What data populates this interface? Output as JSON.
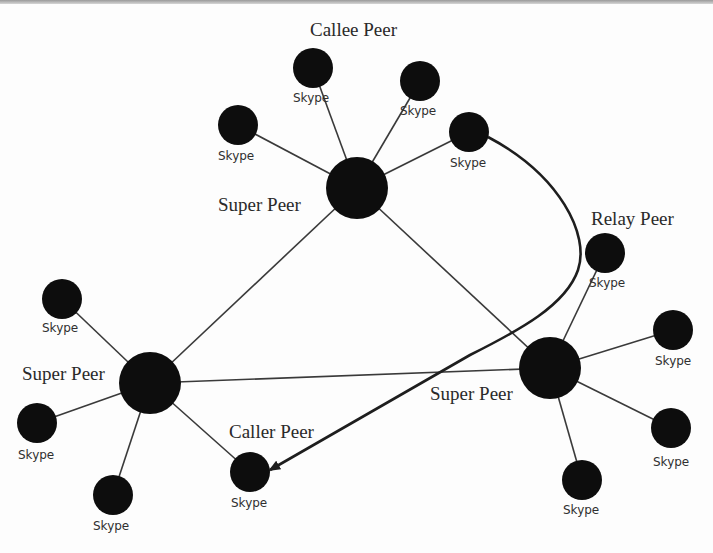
{
  "diagram": {
    "colors": {
      "node": "#0d0d0d",
      "edge": "#3a3a3a",
      "flow": "#1e1e1e",
      "background": "#fdfdfd"
    },
    "roles": {
      "callee": "Callee Peer",
      "relay": "Relay Peer",
      "caller": "Caller Peer",
      "super_top": "Super Peer",
      "super_left": "Super Peer",
      "super_right": "Super Peer"
    },
    "node_label": "Skype",
    "nodes": [
      {
        "id": "sp-top",
        "type": "super",
        "x": 357,
        "y": 188,
        "r": 31
      },
      {
        "id": "sp-left",
        "type": "super",
        "x": 150,
        "y": 383,
        "r": 31
      },
      {
        "id": "sp-right",
        "type": "super",
        "x": 550,
        "y": 368,
        "r": 31
      },
      {
        "id": "callee",
        "type": "client",
        "label": "Skype",
        "x": 313,
        "y": 68,
        "r": 20
      },
      {
        "id": "t-right",
        "type": "client",
        "label": "Skype",
        "x": 420,
        "y": 81,
        "r": 20
      },
      {
        "id": "t-left",
        "type": "client",
        "label": "Skype",
        "x": 238,
        "y": 125,
        "r": 20
      },
      {
        "id": "origin",
        "type": "client",
        "label": "Skype",
        "x": 469,
        "y": 132,
        "r": 20
      },
      {
        "id": "relay",
        "type": "client",
        "label": "Skype",
        "x": 605,
        "y": 253,
        "r": 20
      },
      {
        "id": "r-top",
        "type": "client",
        "label": "Skype",
        "x": 673,
        "y": 330,
        "r": 20
      },
      {
        "id": "r-bot",
        "type": "client",
        "label": "Skype",
        "x": 671,
        "y": 428,
        "r": 20
      },
      {
        "id": "r-low",
        "type": "client",
        "label": "Skype",
        "x": 582,
        "y": 480,
        "r": 20
      },
      {
        "id": "l-top",
        "type": "client",
        "label": "Skype",
        "x": 62,
        "y": 299,
        "r": 20
      },
      {
        "id": "l-mid",
        "type": "client",
        "label": "Skype",
        "x": 37,
        "y": 423,
        "r": 20
      },
      {
        "id": "l-low",
        "type": "client",
        "label": "Skype",
        "x": 113,
        "y": 495,
        "r": 20
      },
      {
        "id": "caller",
        "type": "client",
        "label": "Skype",
        "x": 250,
        "y": 472,
        "r": 20
      }
    ],
    "edges": [
      [
        "sp-top",
        "callee"
      ],
      [
        "sp-top",
        "t-right"
      ],
      [
        "sp-top",
        "t-left"
      ],
      [
        "sp-top",
        "origin"
      ],
      [
        "sp-top",
        "sp-left"
      ],
      [
        "sp-top",
        "sp-right"
      ],
      [
        "sp-left",
        "sp-right"
      ],
      [
        "sp-right",
        "relay"
      ],
      [
        "sp-right",
        "r-top"
      ],
      [
        "sp-right",
        "r-bot"
      ],
      [
        "sp-right",
        "r-low"
      ],
      [
        "sp-left",
        "l-top"
      ],
      [
        "sp-left",
        "l-mid"
      ],
      [
        "sp-left",
        "l-low"
      ],
      [
        "sp-left",
        "caller"
      ]
    ],
    "flow": {
      "from": "origin",
      "via": "relay",
      "to": "caller",
      "arrow": "arrowhead"
    }
  }
}
